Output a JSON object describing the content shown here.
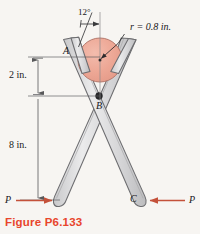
{
  "figure": {
    "caption": "Figure P6.133",
    "caption_color": "#e8452c",
    "background_color": "#f7f5f2"
  },
  "labels": {
    "angle": "12°",
    "radius": "r = 0.8 in.",
    "point_a": "A",
    "point_b": "B",
    "point_c": "C",
    "dim_upper": "2 in.",
    "dim_lower": "8 in.",
    "force_left": "P",
    "force_right": "P"
  },
  "colors": {
    "cylinder_fill": "#eda795",
    "cylinder_stroke": "#b5786b",
    "tool_fill": "#d9d9d9",
    "tool_fill_light": "#ececed",
    "tool_stroke": "#6d6d70",
    "force_arrow": "#c4513a",
    "dimension_line": "#58585a",
    "text": "#17171a"
  },
  "geometry": {
    "cylinder_center_x": 100,
    "cylinder_center_y": 60,
    "cylinder_radius_px": 22,
    "pivot_b_x": 99,
    "pivot_b_y": 96,
    "handle_tip_left_x": 55,
    "handle_tip_left_y": 207,
    "handle_tip_right_x": 147,
    "handle_tip_right_y": 207,
    "dim_axis_x": 38,
    "dim_line_top_y": 57,
    "dim_line_mid_y": 96,
    "dim_line_bottom_y": 200
  },
  "annotations": {
    "angle_value_deg": 12,
    "radius_value_in": 0.8,
    "upper_distance_in": 2,
    "lower_distance_in": 8
  }
}
